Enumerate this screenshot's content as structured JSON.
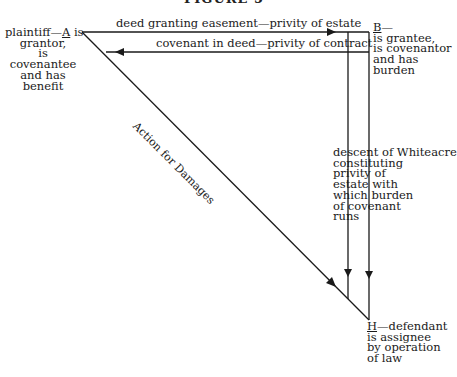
{
  "title": "FIGURE 5",
  "parties": {
    "a": {
      "letter": "A",
      "lines": [
        "plaintiff—",
        " is",
        "grantor,",
        "is",
        "covenantee",
        "and has",
        "benefit"
      ]
    },
    "b": {
      "letter": "B",
      "lines": [
        "—",
        "is grantee,",
        "is covenantor",
        "and has",
        "burden"
      ]
    },
    "h": {
      "letter": "H",
      "lines": [
        "—defendant",
        "is assignee",
        "by operation",
        "of law"
      ]
    }
  },
  "relations": {
    "deed": "deed granting easement—privity of estate",
    "covenant": "covenant in deed—privity of contract",
    "action": "Action for Damages",
    "descent": [
      "descent of Whiteacre",
      "constituting",
      "privity of",
      "estate with",
      "which burden",
      "of covenant",
      "runs"
    ]
  },
  "colors": {
    "ink": "#1a1a1a",
    "background": "#ffffff"
  }
}
